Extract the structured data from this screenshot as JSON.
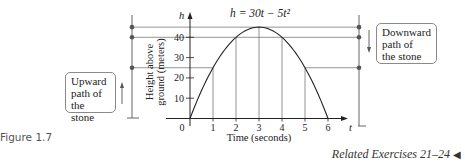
{
  "figure_label": "Figure 1.7",
  "related": {
    "text": "Related Exercises 21–24",
    "arrow": "◀"
  },
  "annotations": {
    "upward": "Upward path of the stone",
    "upward_lines": [
      "Upward",
      "path of",
      "the stone"
    ],
    "downward": "Downward path of the stone",
    "downward_lines": [
      "Downward",
      "path of",
      "the stone"
    ]
  },
  "chart_data": {
    "type": "line",
    "title": "h = 30t − 5t²",
    "xlabel": "Time (seconds)",
    "ylabel": "Height above ground (meters)",
    "x_axis_symbol": "t",
    "y_axis_symbol": "h",
    "xlim": [
      0,
      6
    ],
    "ylim": [
      0,
      45
    ],
    "x_ticks": [
      0,
      1,
      2,
      3,
      4,
      5,
      6
    ],
    "y_ticks": [
      10,
      20,
      30,
      40
    ],
    "grid": false,
    "series": [
      {
        "name": "h = 30t - 5t^2",
        "x": [
          0,
          1,
          2,
          3,
          4,
          5,
          6
        ],
        "y": [
          0,
          25,
          40,
          45,
          40,
          25,
          0
        ]
      }
    ],
    "marked_heights": [
      45,
      40,
      25
    ],
    "vertical_guides_t": [
      1,
      2,
      3,
      4,
      5
    ]
  }
}
